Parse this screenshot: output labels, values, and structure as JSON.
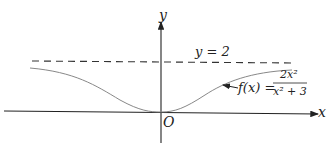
{
  "axes": {
    "x_label": "x",
    "y_label": "y",
    "origin_label": "O"
  },
  "asymptote": {
    "label": "y = 2"
  },
  "function": {
    "lhs": "f(x) =",
    "numerator": "2x²",
    "denominator": "x² + 3"
  },
  "colors": {
    "axis": "#222222",
    "curve": "#888888",
    "dashed": "#333333"
  }
}
